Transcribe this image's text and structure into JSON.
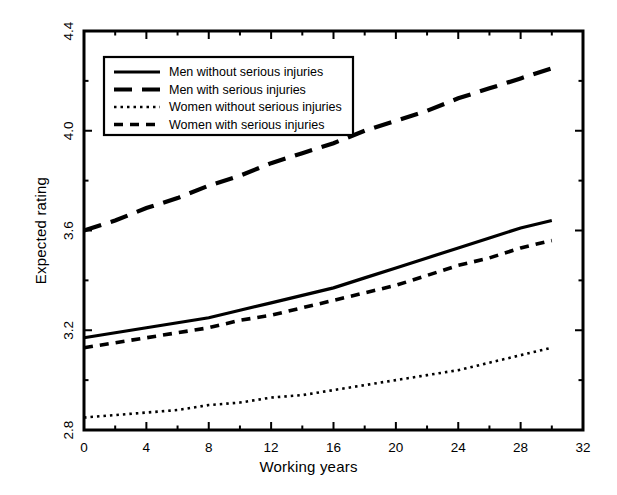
{
  "chart_data": {
    "type": "line",
    "title": "",
    "xlabel": "Working years",
    "ylabel": "Expected rating",
    "xlim": [
      0,
      32
    ],
    "ylim": [
      2.8,
      4.4
    ],
    "x_ticks": [
      0,
      4,
      8,
      12,
      16,
      20,
      24,
      28,
      32
    ],
    "x_tick_labels": [
      "0",
      "4",
      "8",
      "12",
      "16",
      "20",
      "24",
      "28",
      "32"
    ],
    "x_minor_step": 2,
    "y_ticks": [
      2.8,
      3.2,
      3.6,
      4.0,
      4.4
    ],
    "y_tick_labels": [
      "2.8",
      "3.2",
      "3.6",
      "4.0",
      "4.4"
    ],
    "y_minor_step": 0.2,
    "grid": false,
    "legend_position": "upper left",
    "line_color": "#000000",
    "x": [
      0,
      2,
      4,
      6,
      8,
      10,
      12,
      14,
      16,
      18,
      20,
      22,
      24,
      26,
      28,
      30
    ],
    "series": [
      {
        "name": "Men without serious injuries",
        "style": "solid",
        "values": [
          3.17,
          3.19,
          3.21,
          3.23,
          3.25,
          3.28,
          3.31,
          3.34,
          3.37,
          3.41,
          3.45,
          3.49,
          3.53,
          3.57,
          3.61,
          3.64
        ]
      },
      {
        "name": "Men with serious injuries",
        "style": "dashed-long",
        "values": [
          3.6,
          3.64,
          3.69,
          3.73,
          3.78,
          3.82,
          3.87,
          3.91,
          3.95,
          4.0,
          4.04,
          4.08,
          4.13,
          4.17,
          4.21,
          4.25
        ]
      },
      {
        "name": "Women without serious injuries",
        "style": "dotted",
        "values": [
          2.85,
          2.86,
          2.87,
          2.88,
          2.9,
          2.91,
          2.93,
          2.94,
          2.96,
          2.98,
          3.0,
          3.02,
          3.04,
          3.07,
          3.1,
          3.13
        ]
      },
      {
        "name": "Women with serious injuries",
        "style": "dashed-short",
        "values": [
          3.13,
          3.15,
          3.17,
          3.19,
          3.21,
          3.24,
          3.26,
          3.29,
          3.32,
          3.35,
          3.38,
          3.42,
          3.46,
          3.49,
          3.53,
          3.56
        ]
      }
    ],
    "legend_entries": [
      {
        "label": "Men without serious injuries",
        "style": "solid"
      },
      {
        "label": "Men with serious injuries",
        "style": "dashed-long"
      },
      {
        "label": "Women without serious injuries",
        "style": "dotted"
      },
      {
        "label": "Women with serious injuries",
        "style": "dashed-short"
      }
    ]
  }
}
